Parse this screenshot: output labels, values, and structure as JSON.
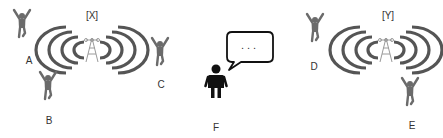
{
  "diagram": {
    "towers": [
      {
        "id": "X",
        "label": "[X]",
        "cx": 92,
        "cy": 50,
        "label_x": 92,
        "label_y": 15
      },
      {
        "id": "Y",
        "label": "[Y]",
        "cx": 386,
        "cy": 50,
        "label_x": 388,
        "label_y": 15
      }
    ],
    "users": [
      {
        "id": "A",
        "label": "A",
        "fx": 22,
        "fy": 24,
        "lx": 29,
        "ly": 60
      },
      {
        "id": "B",
        "label": "B",
        "fx": 48,
        "fy": 86,
        "lx": 49,
        "ly": 120
      },
      {
        "id": "C",
        "label": "C",
        "fx": 160,
        "fy": 52,
        "lx": 161,
        "ly": 84
      },
      {
        "id": "D",
        "label": "D",
        "fx": 315,
        "fy": 28,
        "lx": 314,
        "ly": 66
      },
      {
        "id": "E",
        "label": "E",
        "fx": 410,
        "fy": 92,
        "lx": 412,
        "ly": 125
      }
    ],
    "speaker": {
      "id": "F",
      "label": "F",
      "bubble_text": "...",
      "lx": 216,
      "ly": 127
    },
    "colors": {
      "arc": "#555555",
      "figure": "#6b6b6b",
      "tower": "#9a9a9a",
      "speaker": "#111111",
      "label": "#333333"
    }
  }
}
